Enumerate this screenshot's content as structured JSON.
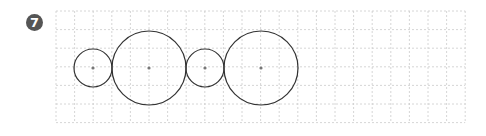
{
  "problem": {
    "number": "7"
  },
  "grid": {
    "x": 56,
    "y": 11,
    "cols": 22,
    "rows": 6,
    "cell": 18.6,
    "line_color": "#cccccc"
  },
  "circles": [
    {
      "cx": 93,
      "cy": 68,
      "r": 19,
      "label": "small circle 1"
    },
    {
      "cx": 149,
      "cy": 68,
      "r": 37,
      "label": "large circle 1"
    },
    {
      "cx": 205,
      "cy": 68,
      "r": 19,
      "label": "small circle 2"
    },
    {
      "cx": 261,
      "cy": 68,
      "r": 37,
      "label": "large circle 2"
    }
  ],
  "colors": {
    "badge": "#555555",
    "stroke": "#333333",
    "center_dot": "#777777"
  }
}
